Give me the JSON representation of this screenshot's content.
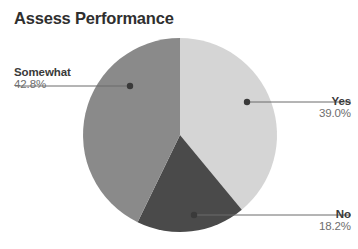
{
  "chart_data": {
    "type": "pie",
    "title": "Assess Performance",
    "categories": [
      "Yes",
      "No",
      "Somewhat"
    ],
    "values": [
      39.0,
      18.2,
      42.8
    ],
    "labels": [
      "39.0%",
      "18.2%",
      "42.8%"
    ],
    "unit": "%",
    "colors": [
      "#d5d5d5",
      "#4a4a4a",
      "#8a8a8a"
    ],
    "start_angle_deg": 0,
    "direction": "clockwise",
    "legend": "none",
    "grid": false,
    "slices": [
      {
        "name": "Yes",
        "value": 39.0,
        "label": "39.0%",
        "color": "#d5d5d5"
      },
      {
        "name": "No",
        "value": 18.2,
        "label": "18.2%",
        "color": "#4a4a4a"
      },
      {
        "name": "Somewhat",
        "value": 42.8,
        "label": "42.8%",
        "color": "#8a8a8a"
      }
    ]
  },
  "title": "Assess Performance",
  "callouts": {
    "somewhat": {
      "category": "Somewhat",
      "percent": "42.8%"
    },
    "yes": {
      "category": "Yes",
      "percent": "39.0%"
    },
    "no": {
      "category": "No",
      "percent": "18.2%"
    }
  },
  "style": {
    "background": "#ffffff",
    "title_color": "#2f2f2f",
    "category_color": "#3a3a3a",
    "percent_color": "#6e6e6e",
    "leader_color": "#6b6b6b"
  }
}
